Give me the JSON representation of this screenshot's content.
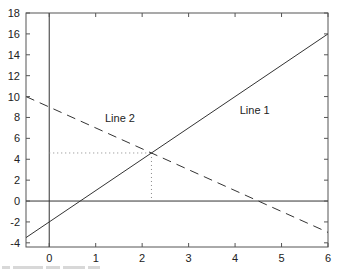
{
  "chart_data": {
    "type": "line",
    "title": "",
    "xlabel": "",
    "ylabel": "",
    "xlim": [
      -0.5,
      6
    ],
    "ylim": [
      -4.4,
      18
    ],
    "x_ticks": [
      0,
      1,
      2,
      3,
      4,
      5,
      6
    ],
    "y_ticks": [
      -4,
      -2,
      0,
      2,
      4,
      6,
      8,
      10,
      12,
      14,
      16,
      18
    ],
    "grid": false,
    "legend": "none (inline labels)",
    "series": [
      {
        "name": "Line 1",
        "style": "solid",
        "equation": "y = 3x - 2",
        "x": [
          -0.5,
          6
        ],
        "y": [
          -3.5,
          16
        ],
        "label_pos": [
          4.1,
          8.3
        ]
      },
      {
        "name": "Line 2",
        "style": "dashed",
        "equation": "y = 9 - 2x",
        "x": [
          -0.5,
          6
        ],
        "y": [
          10,
          -3
        ],
        "label_pos": [
          1.2,
          7.6
        ]
      }
    ],
    "reference_lines": [
      {
        "type": "horizontal",
        "y": 0,
        "style": "solid"
      },
      {
        "type": "vertical",
        "x": 0,
        "style": "solid"
      }
    ],
    "annotations": [
      {
        "type": "intersection-guides",
        "x": 2.2,
        "y": 4.6,
        "style": "dotted"
      }
    ]
  }
}
